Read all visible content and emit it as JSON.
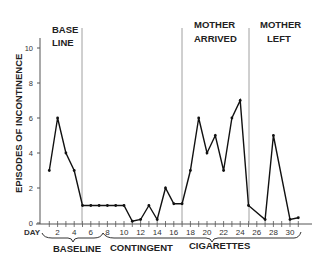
{
  "chart_data": {
    "type": "line",
    "title": "",
    "xlabel": "DAY",
    "ylabel": "EPISODES OF INCONTINENCE",
    "ylim": [
      0,
      11
    ],
    "xlim": [
      0,
      32
    ],
    "yticks": [
      0,
      2,
      4,
      6,
      8,
      10
    ],
    "xticks": [
      2,
      4,
      6,
      8,
      10,
      12,
      14,
      16,
      18,
      20,
      22,
      24,
      26,
      28,
      30
    ],
    "grid": false,
    "legend": "none",
    "series": [
      {
        "name": "Episodes of incontinence",
        "x": [
          1,
          2,
          3,
          4,
          5,
          6,
          7,
          8,
          9,
          10,
          11,
          12,
          13,
          14,
          15,
          16,
          17,
          18,
          19,
          20,
          21,
          22,
          23,
          24,
          25,
          27,
          28,
          30,
          31
        ],
        "values": [
          3,
          6,
          4,
          3,
          1,
          1,
          1,
          1,
          1,
          1,
          0.1,
          0.2,
          1,
          0.2,
          2,
          1.1,
          1.1,
          3,
          6,
          4,
          5,
          3,
          6,
          7,
          1,
          0.2,
          5,
          0.2,
          0.3
        ]
      }
    ],
    "phase_lines": [
      5,
      17,
      25
    ],
    "phase_labels": [
      {
        "line1": "BASE",
        "line2": "LINE",
        "x": 3
      },
      {
        "line1": "MOTHER",
        "line2": "ARRIVED",
        "x": 21
      },
      {
        "line1": "MOTHER",
        "line2": "LEFT",
        "x": 28.5
      }
    ],
    "bracket_labels": [
      {
        "label": "BASELINE",
        "from": 1,
        "to": 7
      },
      {
        "label": "CONTINGENT",
        "from": 7.5,
        "to": 31
      },
      {
        "label": "CIGARETTES",
        "from": 7.5,
        "to": 31
      }
    ]
  },
  "labels": {
    "y_axis": "EPISODES OF INCONTINENCE",
    "x_axis": "DAY",
    "baseline_top_1": "BASE",
    "baseline_top_2": "LINE",
    "mother_arrived_1": "MOTHER",
    "mother_arrived_2": "ARRIVED",
    "mother_left_1": "MOTHER",
    "mother_left_2": "LEFT",
    "bracket_baseline": "BASELINE",
    "bracket_contingent": "CONTINGENT",
    "bracket_cigarettes": "CIGARETTES"
  }
}
